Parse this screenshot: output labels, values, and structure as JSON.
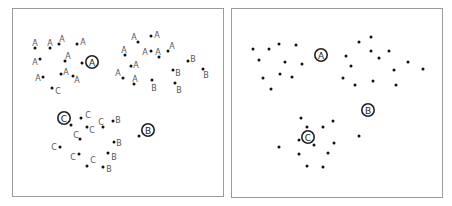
{
  "figure": {
    "panels": [
      {
        "id": "labeled",
        "box": {
          "x": 12,
          "y": 8,
          "w": 212,
          "h": 189
        },
        "points": [
          {
            "x": 35,
            "y": 48,
            "label": "A",
            "lx": 35,
            "ly": 43
          },
          {
            "x": 50,
            "y": 48,
            "label": "A",
            "lx": 50,
            "ly": 43
          },
          {
            "x": 59,
            "y": 44,
            "label": "A",
            "lx": 62,
            "ly": 39
          },
          {
            "x": 77,
            "y": 44,
            "label": "A",
            "lx": 83,
            "ly": 42
          },
          {
            "x": 40,
            "y": 59,
            "label": "A",
            "lx": 35,
            "ly": 62
          },
          {
            "x": 65,
            "y": 61,
            "label": "A",
            "lx": 68,
            "ly": 56
          },
          {
            "x": 82,
            "y": 63,
            "label": "",
            "lx": 0,
            "ly": 0
          },
          {
            "x": 43,
            "y": 77,
            "label": "A",
            "lx": 38,
            "ly": 78
          },
          {
            "x": 61,
            "y": 74,
            "label": "A",
            "lx": 66,
            "ly": 72
          },
          {
            "x": 73,
            "y": 76,
            "label": "A",
            "lx": 77,
            "ly": 80
          },
          {
            "x": 52,
            "y": 88,
            "label": "C",
            "lx": 58,
            "ly": 91
          },
          {
            "x": 138,
            "y": 42,
            "label": "A",
            "lx": 134,
            "ly": 37
          },
          {
            "x": 151,
            "y": 36,
            "label": "A",
            "lx": 157,
            "ly": 35
          },
          {
            "x": 125,
            "y": 55,
            "label": "A",
            "lx": 124,
            "ly": 50
          },
          {
            "x": 151,
            "y": 51,
            "label": "A",
            "lx": 145,
            "ly": 52
          },
          {
            "x": 159,
            "y": 57,
            "label": "A",
            "lx": 158,
            "ly": 52
          },
          {
            "x": 168,
            "y": 51,
            "label": "A",
            "lx": 172,
            "ly": 46
          },
          {
            "x": 188,
            "y": 61,
            "label": "B",
            "lx": 193,
            "ly": 59
          },
          {
            "x": 131,
            "y": 66,
            "label": "A",
            "lx": 136,
            "ly": 65
          },
          {
            "x": 173,
            "y": 70,
            "label": "B",
            "lx": 178,
            "ly": 73
          },
          {
            "x": 203,
            "y": 69,
            "label": "B",
            "lx": 206,
            "ly": 75
          },
          {
            "x": 123,
            "y": 78,
            "label": "A",
            "lx": 118,
            "ly": 73
          },
          {
            "x": 134,
            "y": 84,
            "label": "A",
            "lx": 135,
            "ly": 79
          },
          {
            "x": 152,
            "y": 80,
            "label": "B",
            "lx": 154,
            "ly": 88
          },
          {
            "x": 175,
            "y": 83,
            "label": "B",
            "lx": 179,
            "ly": 90
          },
          {
            "x": 71,
            "y": 125,
            "label": "",
            "lx": 0,
            "ly": 0
          },
          {
            "x": 81,
            "y": 118,
            "label": "C",
            "lx": 88,
            "ly": 115
          },
          {
            "x": 87,
            "y": 127,
            "label": "C",
            "lx": 92,
            "ly": 130
          },
          {
            "x": 103,
            "y": 127,
            "label": "C",
            "lx": 101,
            "ly": 122
          },
          {
            "x": 113,
            "y": 121,
            "label": "B",
            "lx": 118,
            "ly": 120
          },
          {
            "x": 80,
            "y": 139,
            "label": "C",
            "lx": 76,
            "ly": 135
          },
          {
            "x": 60,
            "y": 147,
            "label": "C",
            "lx": 54,
            "ly": 147
          },
          {
            "x": 114,
            "y": 142,
            "label": "B",
            "lx": 119,
            "ly": 143
          },
          {
            "x": 79,
            "y": 154,
            "label": "C",
            "lx": 73,
            "ly": 157
          },
          {
            "x": 108,
            "y": 153,
            "label": "B",
            "lx": 114,
            "ly": 157
          },
          {
            "x": 87,
            "y": 166,
            "label": "C",
            "lx": 93,
            "ly": 160
          },
          {
            "x": 103,
            "y": 167,
            "label": "B",
            "lx": 109,
            "ly": 169
          },
          {
            "x": 139,
            "y": 136,
            "label": "",
            "lx": 0,
            "ly": 0
          }
        ],
        "centroids": [
          {
            "label": "A",
            "x": 92,
            "y": 62
          },
          {
            "label": "C",
            "x": 64,
            "y": 118
          },
          {
            "label": "B",
            "x": 148,
            "y": 130
          }
        ]
      },
      {
        "id": "unlabeled",
        "box": {
          "x": 231,
          "y": 8,
          "w": 212,
          "h": 190
        },
        "points": [
          {
            "x": 253,
            "y": 49
          },
          {
            "x": 269,
            "y": 49
          },
          {
            "x": 279,
            "y": 44
          },
          {
            "x": 296,
            "y": 45
          },
          {
            "x": 259,
            "y": 60
          },
          {
            "x": 285,
            "y": 62
          },
          {
            "x": 302,
            "y": 64
          },
          {
            "x": 263,
            "y": 78
          },
          {
            "x": 280,
            "y": 74
          },
          {
            "x": 292,
            "y": 77
          },
          {
            "x": 271,
            "y": 89
          },
          {
            "x": 359,
            "y": 42
          },
          {
            "x": 371,
            "y": 37
          },
          {
            "x": 346,
            "y": 56
          },
          {
            "x": 371,
            "y": 51
          },
          {
            "x": 379,
            "y": 58
          },
          {
            "x": 389,
            "y": 51
          },
          {
            "x": 408,
            "y": 62
          },
          {
            "x": 423,
            "y": 69
          },
          {
            "x": 351,
            "y": 66
          },
          {
            "x": 394,
            "y": 70
          },
          {
            "x": 343,
            "y": 78
          },
          {
            "x": 355,
            "y": 85
          },
          {
            "x": 373,
            "y": 81
          },
          {
            "x": 396,
            "y": 85
          },
          {
            "x": 301,
            "y": 118
          },
          {
            "x": 333,
            "y": 121
          },
          {
            "x": 307,
            "y": 127
          },
          {
            "x": 323,
            "y": 127
          },
          {
            "x": 299,
            "y": 140
          },
          {
            "x": 314,
            "y": 145
          },
          {
            "x": 334,
            "y": 143
          },
          {
            "x": 279,
            "y": 147
          },
          {
            "x": 359,
            "y": 136
          },
          {
            "x": 299,
            "y": 154
          },
          {
            "x": 328,
            "y": 153
          },
          {
            "x": 307,
            "y": 166
          },
          {
            "x": 323,
            "y": 167
          }
        ],
        "centroids": [
          {
            "label": "A",
            "x": 321,
            "y": 55
          },
          {
            "label": "B",
            "x": 368,
            "y": 110
          },
          {
            "label": "C",
            "x": 308,
            "y": 137
          }
        ]
      }
    ],
    "colors": {
      "border": "#9a9a9a",
      "dot": "#111111",
      "label": "#555555",
      "centroid": "#222222"
    }
  }
}
